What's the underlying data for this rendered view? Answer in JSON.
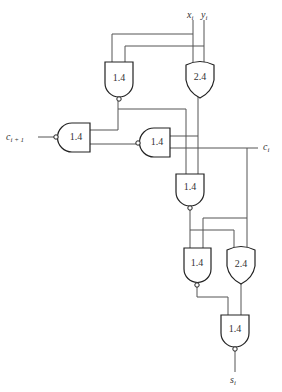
{
  "diagram": {
    "type": "logic-circuit",
    "signals": {
      "x": {
        "base": "x",
        "sub": "i"
      },
      "y": {
        "base": "y",
        "sub": "i"
      },
      "c_in": {
        "base": "c",
        "sub": "i"
      },
      "c_out": {
        "base": "c",
        "sub": "i + 1"
      },
      "s": {
        "base": "s",
        "sub": "i"
      }
    },
    "gates": [
      {
        "id": "g1",
        "type": "NAND",
        "delay": "1.4"
      },
      {
        "id": "g2",
        "type": "OR",
        "delay": "2.4"
      },
      {
        "id": "g3",
        "type": "NAND",
        "delay": "1.4"
      },
      {
        "id": "g4",
        "type": "NAND",
        "delay": "1.4"
      },
      {
        "id": "g5",
        "type": "NAND",
        "delay": "1.4"
      },
      {
        "id": "g6",
        "type": "NAND",
        "delay": "1.4"
      },
      {
        "id": "g7",
        "type": "OR",
        "delay": "2.4"
      },
      {
        "id": "g8",
        "type": "NAND",
        "delay": "1.4"
      }
    ]
  }
}
